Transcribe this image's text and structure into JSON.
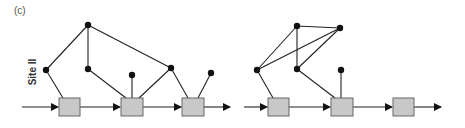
{
  "panel_label": "(c)",
  "site_label": "Site II",
  "colors": {
    "line": "#222222",
    "node": "#111111",
    "box_fill": "#c8c8c8",
    "box_stroke": "#555555"
  },
  "diagrams": [
    {
      "name": "left",
      "chain": {
        "y": 107,
        "start_x": 22,
        "end_x": 230,
        "boxes": [
          59,
          121,
          182
        ]
      },
      "nodes": [
        {
          "id": "top",
          "x": 88,
          "y": 25
        },
        {
          "id": "left",
          "x": 46,
          "y": 70
        },
        {
          "id": "mid",
          "x": 88,
          "y": 69
        },
        {
          "id": "above-box2",
          "x": 132,
          "y": 75
        },
        {
          "id": "right",
          "x": 171,
          "y": 68
        },
        {
          "id": "above-box3",
          "x": 211,
          "y": 73
        }
      ]
    },
    {
      "name": "right",
      "chain": {
        "y": 107,
        "start_x": 244,
        "end_x": 441,
        "boxes": [
          268,
          331,
          393
        ]
      },
      "nodes": [
        {
          "id": "top-a",
          "x": 297,
          "y": 26
        },
        {
          "id": "top-b",
          "x": 340,
          "y": 28
        },
        {
          "id": "left",
          "x": 257,
          "y": 70
        },
        {
          "id": "mid",
          "x": 297,
          "y": 69
        },
        {
          "id": "above-box2",
          "x": 341,
          "y": 70
        }
      ]
    }
  ]
}
